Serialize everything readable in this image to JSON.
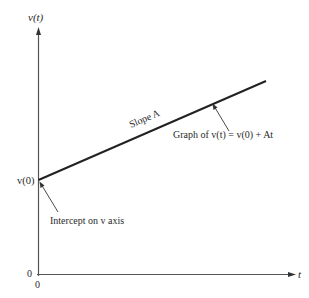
{
  "diagram": {
    "y_axis_label": "v(t)",
    "x_axis_label": "t",
    "origin_y_label": "0",
    "origin_x_label": "0",
    "intercept_label": "v(0)",
    "slope_label": "Slope A",
    "graph_label": "Graph of v(t) = v(0) + At",
    "intercept_annotation": "Intercept on v axis",
    "line_color": "#222222",
    "axis_color": "#555555"
  }
}
